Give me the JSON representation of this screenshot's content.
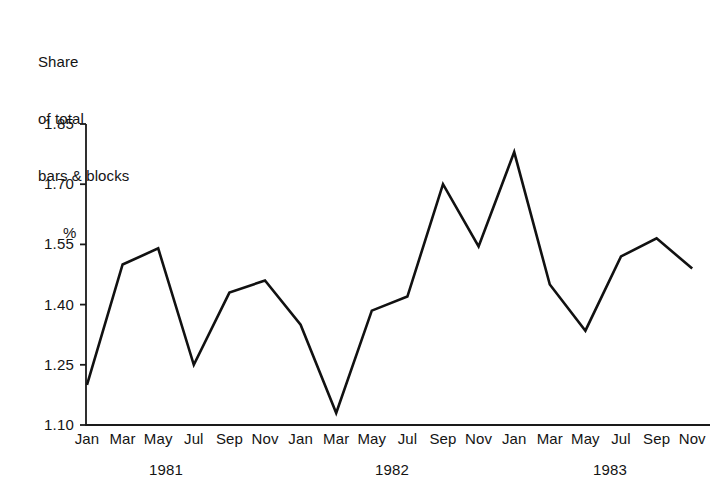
{
  "title": {
    "line1": "Share",
    "line2": "of total",
    "line3": "bars & blocks",
    "line4": "%"
  },
  "chart_data": {
    "type": "line",
    "title": "Share of total bars & blocks %",
    "xlabel": "",
    "ylabel": "Share of total bars & blocks %",
    "ylim": [
      1.1,
      1.85
    ],
    "ytick_labels": [
      "1.85",
      "1.70",
      "1.55",
      "1.40",
      "1.25",
      "1.10"
    ],
    "ytick_values": [
      1.85,
      1.7,
      1.55,
      1.4,
      1.25,
      1.1
    ],
    "grid": false,
    "legend": "none",
    "categories": [
      "Jan",
      "Mar",
      "May",
      "Jul",
      "Sep",
      "Nov",
      "Jan",
      "Mar",
      "May",
      "Jul",
      "Sep",
      "Nov",
      "Jan",
      "Mar",
      "May",
      "Jul",
      "Sep",
      "Nov"
    ],
    "period_labels": [
      "1981",
      "1982",
      "1983"
    ],
    "x": [
      "Jan 1981",
      "Mar 1981",
      "May 1981",
      "Jul 1981",
      "Sep 1981",
      "Nov 1981",
      "Jan 1982",
      "Mar 1982",
      "May 1982",
      "Jul 1982",
      "Sep 1982",
      "Nov 1982",
      "Jan 1983",
      "Mar 1983",
      "May 1983",
      "Jul 1983",
      "Sep 1983",
      "Nov 1983"
    ],
    "values": [
      1.2,
      1.5,
      1.54,
      1.25,
      1.43,
      1.46,
      1.35,
      1.13,
      1.385,
      1.42,
      1.7,
      1.545,
      1.78,
      1.45,
      1.335,
      1.52,
      1.565,
      1.49
    ],
    "line_color": "#111111",
    "line_width": 2.6,
    "axis_color": "#1a1a1a"
  },
  "geometry": {
    "plot_left": 86,
    "plot_right": 710,
    "plot_top": 124,
    "plot_bottom": 425,
    "y_top_value": 1.85,
    "y_bottom_value": 1.1,
    "x_first": 87,
    "x_step": 35.6,
    "year_label_x": [
      166,
      392,
      610
    ],
    "year_label_y": 461,
    "xtick_label_y": 430
  }
}
